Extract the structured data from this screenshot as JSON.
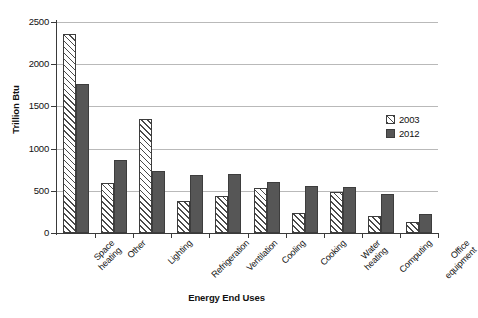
{
  "chart_data": {
    "type": "bar",
    "title": "",
    "xlabel": "Energy End Uses",
    "ylabel": "Trillion Btu",
    "ylim": [
      0,
      2500
    ],
    "yticks": [
      0,
      500,
      1000,
      1500,
      2000,
      2500
    ],
    "ytick_labels": [
      "0",
      "500",
      "1000",
      "1500",
      "2000",
      "2500"
    ],
    "grid": "horizontal",
    "legend_position": "right-middle",
    "categories": [
      "Space heating",
      "Other",
      "Lighting",
      "Refrigeration",
      "Ventilation",
      "Cooling",
      "Cooking",
      "Water heating",
      "Computing",
      "Office equipment"
    ],
    "category_lines": [
      [
        "Space",
        "heating"
      ],
      [
        "Other"
      ],
      [
        "Lighting"
      ],
      [
        "Refrigeration"
      ],
      [
        "Ventilation"
      ],
      [
        "Cooling"
      ],
      [
        "Cooking"
      ],
      [
        "Water",
        "heating"
      ],
      [
        "Computing"
      ],
      [
        "Office",
        "equipment"
      ]
    ],
    "series": [
      {
        "name": "2003",
        "values": [
          2360,
          590,
          1350,
          380,
          440,
          530,
          240,
          490,
          200,
          130
        ]
      },
      {
        "name": "2012",
        "values": [
          1760,
          860,
          740,
          690,
          700,
          600,
          560,
          540,
          460,
          220
        ]
      }
    ]
  },
  "legend": {
    "items": [
      {
        "label": "2003",
        "swatch": "hatched-diagonal"
      },
      {
        "label": "2012",
        "swatch": "solid-dark-gray"
      }
    ]
  },
  "colors": {
    "series_2003_fill": "#ffffff",
    "series_2003_hatch": "#4a4a4a",
    "series_2012_fill": "#565656",
    "bar_outline": "#3d3d3d",
    "gridline": "#b9b9b9",
    "axis": "#3a3a3a",
    "text": "#111111",
    "background": "#ffffff"
  }
}
